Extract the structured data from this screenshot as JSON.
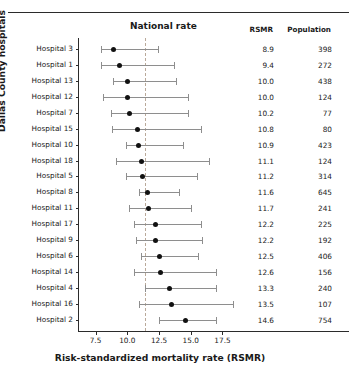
{
  "figure": {
    "national_rate_label": "National rate",
    "x_axis_title": "Risk-standardized mortality rate (RSMR)",
    "y_axis_title": "Dallas County hospitals",
    "rsmr_header": "RSMR",
    "population_header": "Population"
  },
  "chart_data": {
    "type": "scatter",
    "title": "",
    "xlabel": "Risk-standardized mortality rate (RSMR)",
    "ylabel": "Dallas County hospitals",
    "xlim": [
      6.2,
      18.8
    ],
    "xticks": [
      7.5,
      10.0,
      12.5,
      15.0,
      17.5
    ],
    "xtick_labels": [
      "7.5",
      "10.0",
      "12.5",
      "15.0",
      "17.5"
    ],
    "grid": false,
    "legend": "none",
    "national_rate": 11.4,
    "annotations": [
      "National rate"
    ],
    "categories": [
      "Hospital 3",
      "Hospital 1",
      "Hospital 13",
      "Hospital 12",
      "Hospital 7",
      "Hospital 15",
      "Hospital 10",
      "Hospital 18",
      "Hospital 5",
      "Hospital 8",
      "Hospital 11",
      "Hospital 17",
      "Hospital 9",
      "Hospital 6",
      "Hospital 14",
      "Hospital 4",
      "Hospital 16",
      "Hospital 2"
    ],
    "columns": [
      "Hospital",
      "RSMR",
      "Population",
      "CI low",
      "CI high"
    ],
    "rows": [
      {
        "hospital": "Hospital 3",
        "rsmr": "8.9",
        "rsmr_value": 8.9,
        "population": "398",
        "ci_low": 7.9,
        "ci_high": 12.4
      },
      {
        "hospital": "Hospital 1",
        "rsmr": "9.4",
        "rsmr_value": 9.4,
        "population": "272",
        "ci_low": 7.9,
        "ci_high": 13.7
      },
      {
        "hospital": "Hospital 13",
        "rsmr": "10.0",
        "rsmr_value": 10.0,
        "population": "438",
        "ci_low": 8.9,
        "ci_high": 13.8
      },
      {
        "hospital": "Hospital 12",
        "rsmr": "10.0",
        "rsmr_value": 10.0,
        "population": "124",
        "ci_low": 8.1,
        "ci_high": 14.8
      },
      {
        "hospital": "Hospital 7",
        "rsmr": "10.2",
        "rsmr_value": 10.2,
        "population": "77",
        "ci_low": 8.7,
        "ci_high": 14.8
      },
      {
        "hospital": "Hospital 15",
        "rsmr": "10.8",
        "rsmr_value": 10.8,
        "population": "80",
        "ci_low": 8.8,
        "ci_high": 15.8
      },
      {
        "hospital": "Hospital 10",
        "rsmr": "10.9",
        "rsmr_value": 10.9,
        "population": "423",
        "ci_low": 9.9,
        "ci_high": 14.4
      },
      {
        "hospital": "Hospital 18",
        "rsmr": "11.1",
        "rsmr_value": 11.1,
        "population": "124",
        "ci_low": 9.1,
        "ci_high": 16.4
      },
      {
        "hospital": "Hospital 5",
        "rsmr": "11.2",
        "rsmr_value": 11.2,
        "population": "314",
        "ci_low": 9.9,
        "ci_high": 15.5
      },
      {
        "hospital": "Hospital 8",
        "rsmr": "11.6",
        "rsmr_value": 11.6,
        "population": "645",
        "ci_low": 10.9,
        "ci_high": 14.1
      },
      {
        "hospital": "Hospital 11",
        "rsmr": "11.7",
        "rsmr_value": 11.7,
        "population": "241",
        "ci_low": 10.1,
        "ci_high": 15.0
      },
      {
        "hospital": "Hospital 17",
        "rsmr": "12.2",
        "rsmr_value": 12.2,
        "population": "225",
        "ci_low": 10.5,
        "ci_high": 15.8
      },
      {
        "hospital": "Hospital 9",
        "rsmr": "12.2",
        "rsmr_value": 12.2,
        "population": "192",
        "ci_low": 10.7,
        "ci_high": 15.9
      },
      {
        "hospital": "Hospital 6",
        "rsmr": "12.5",
        "rsmr_value": 12.5,
        "population": "406",
        "ci_low": 11.1,
        "ci_high": 15.6
      },
      {
        "hospital": "Hospital 14",
        "rsmr": "12.6",
        "rsmr_value": 12.6,
        "population": "156",
        "ci_low": 10.5,
        "ci_high": 17.0
      },
      {
        "hospital": "Hospital 4",
        "rsmr": "13.3",
        "rsmr_value": 13.3,
        "population": "240",
        "ci_low": 11.4,
        "ci_high": 17.0
      },
      {
        "hospital": "Hospital 16",
        "rsmr": "13.5",
        "rsmr_value": 13.5,
        "population": "107",
        "ci_low": 10.9,
        "ci_high": 18.3
      },
      {
        "hospital": "Hospital 2",
        "rsmr": "14.6",
        "rsmr_value": 14.6,
        "population": "754",
        "ci_low": 12.5,
        "ci_high": 17.0
      }
    ]
  }
}
